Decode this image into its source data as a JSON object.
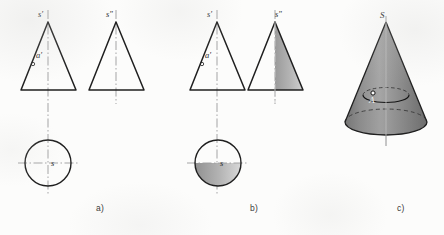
{
  "figure": {
    "background_color": "#fcfcfb",
    "line_color": "#1f1f1f",
    "centerline_color": "#8f8f8f",
    "shade_color": "#8c8c8c",
    "shade_color_light": "#d2d2d2",
    "label_color": "#2b2b2b",
    "caption_color": "#3a3a3a"
  },
  "panels": [
    {
      "id": "a",
      "caption": "a)",
      "caption_x": 96,
      "caption_y": 209,
      "description": "Unshaded two-view orthographic projection of a cone plus top view circle",
      "views": [
        {
          "id": "a-front",
          "type": "triangle-outline",
          "labels": [
            {
              "text": "s'",
              "x": 38,
              "y": 17
            },
            {
              "text": "a'",
              "x": 36,
              "y": 58
            }
          ],
          "point_markers": [
            {
              "name": "a-prime-point",
              "x": 33,
              "y": 64
            }
          ]
        },
        {
          "id": "a-side",
          "type": "triangle-outline",
          "labels": [
            {
              "text": "s\"",
              "x": 106,
              "y": 17
            }
          ],
          "point_markers": []
        },
        {
          "id": "a-top",
          "type": "circle-outline",
          "labels": [
            {
              "text": "s",
              "x": 51,
              "y": 166
            }
          ],
          "point_markers": []
        }
      ]
    },
    {
      "id": "b",
      "caption": "b)",
      "caption_x": 250,
      "caption_y": 209,
      "description": "Same two-view projection with shaded halves indicating the visible surface",
      "views": [
        {
          "id": "b-front",
          "type": "triangle-outline",
          "labels": [
            {
              "text": "s'",
              "x": 207,
              "y": 17
            },
            {
              "text": "a'",
              "x": 205,
              "y": 58
            }
          ],
          "point_markers": [
            {
              "name": "a-prime-point",
              "x": 202,
              "y": 64
            }
          ]
        },
        {
          "id": "b-side",
          "type": "triangle-half-shaded",
          "labels": [
            {
              "text": "s\"",
              "x": 275,
              "y": 17
            }
          ],
          "point_markers": []
        },
        {
          "id": "b-top",
          "type": "circle-half-shaded",
          "labels": [
            {
              "text": "s",
              "x": 220,
              "y": 166
            }
          ],
          "point_markers": []
        }
      ]
    },
    {
      "id": "c",
      "caption": "c)",
      "caption_x": 397,
      "caption_y": 209,
      "description": "Shaded pictorial view of the cone with apex S and surface point A on a parallel circle",
      "views": [
        {
          "id": "c-pictorial",
          "type": "cone-3d",
          "labels": [
            {
              "text": "S",
              "x": 384,
              "y": 18
            },
            {
              "text": "A",
              "x": 369,
              "y": 101
            }
          ],
          "point_markers": [
            {
              "name": "point-a",
              "x": 373,
              "y": 93
            }
          ]
        }
      ]
    }
  ]
}
